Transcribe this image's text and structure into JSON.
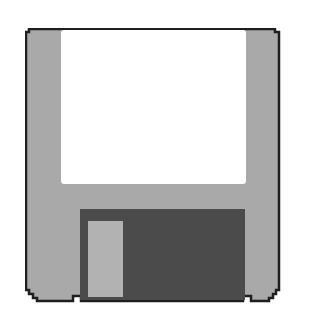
{
  "icon": {
    "name": "floppy-disk",
    "description": "3.5-inch floppy disk save icon"
  },
  "colors": {
    "body": "#a9a9a9",
    "outline": "#1e1e1e",
    "label": "#ffffff",
    "shutter": "#4b4b4b",
    "shutter_slot": "#b2b2b2",
    "background": "#ffffff"
  }
}
